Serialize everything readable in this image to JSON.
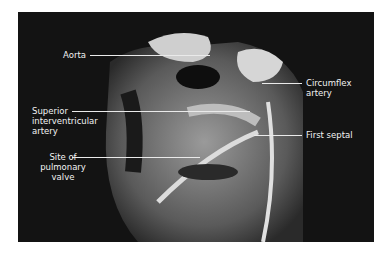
{
  "figure": {
    "labels": [
      {
        "id": "aorta",
        "text": "Aorta"
      },
      {
        "id": "circumflex",
        "text": "Circumflex artery"
      },
      {
        "id": "superior",
        "text": "Superior interventricular artery"
      },
      {
        "id": "first_septal",
        "text": "First septal"
      },
      {
        "id": "pulmonary",
        "text": "Site of pulmonary valve"
      }
    ],
    "lines": {
      "circumflex": [
        "Circumflex",
        "artery"
      ],
      "superior": [
        "Superior",
        "interventricular",
        "artery"
      ],
      "pulmonary": [
        "Site of",
        "pulmonary",
        "valve"
      ]
    },
    "colors": {
      "background": "#131313",
      "text": "#f2f2f2",
      "page": "#ffffff"
    }
  }
}
